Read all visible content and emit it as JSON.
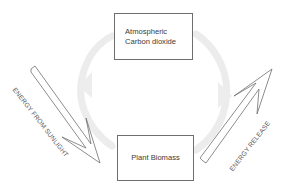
{
  "diagram": {
    "title": "",
    "nodes": [
      {
        "id": "atmospheric-co2",
        "label_line1": "Atmospheric",
        "label_line2": "Carbon dioxide"
      },
      {
        "id": "plant-biomass",
        "label": "Plant Biomass"
      }
    ],
    "arrows": [
      {
        "id": "energy-from-sunlight",
        "label": "ENERGY FROM SUNLIGHT",
        "direction": "into plant-biomass"
      },
      {
        "id": "energy-release",
        "label": "ENERGY RELEASE",
        "direction": "out of plant-biomass"
      }
    ],
    "background_cycle": {
      "description": "faint circular cycle arrows between the two boxes",
      "color": "#ececec"
    },
    "colors": {
      "line": "#6e6e6e",
      "text": "#3a3a3a",
      "cycle": "#ececec",
      "background": "#ffffff"
    }
  }
}
